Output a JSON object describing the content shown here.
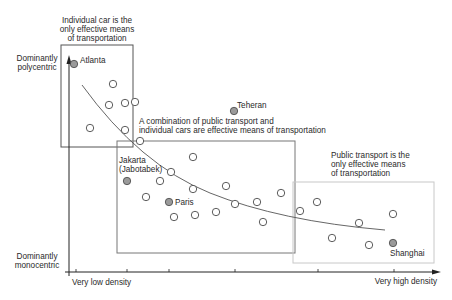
{
  "chart_data": {
    "type": "scatter",
    "title": "",
    "xlabel": "Density",
    "ylabel": "Urban structure",
    "x_axis": {
      "min_label": "Very low density",
      "max_label": "Very high density",
      "ticks_px": [
        76,
        127,
        169,
        235,
        318,
        394
      ]
    },
    "y_axis": {
      "top_label": [
        "Dominantly",
        "polycentric"
      ],
      "bottom_label": [
        "Dominantly",
        "monocentric"
      ]
    },
    "grid": false,
    "legend": null,
    "zones": [
      {
        "id": "car-zone",
        "label": [
          "Individual car is the",
          "only effective means",
          "of transportation"
        ],
        "x": 61,
        "y": 45,
        "w": 72,
        "h": 102,
        "stroke": "#555555"
      },
      {
        "id": "mixed-zone",
        "label": [
          "A combination of public transport and",
          "individual cars are effective means of transportation"
        ],
        "x": 117,
        "y": 141,
        "w": 178,
        "h": 112,
        "stroke": "#777777"
      },
      {
        "id": "public-zone",
        "label": [
          "Public transport is the",
          "only effective means",
          "of transportation"
        ],
        "x": 293,
        "y": 182,
        "w": 141,
        "h": 81,
        "stroke": "#c8c8c8"
      }
    ],
    "named_cities": [
      {
        "name": "Atlanta",
        "x": 74,
        "y": 64,
        "label_dx": 6,
        "label_dy": -1
      },
      {
        "name": "Teheran",
        "x": 234,
        "y": 111,
        "label_dx": 3,
        "label_dy": -3
      },
      {
        "name": [
          "Jakarta",
          "(Jabotabek)"
        ],
        "x": 127,
        "y": 181,
        "label_dx": -8,
        "label_dy": -22
      },
      {
        "name": "Paris",
        "x": 169,
        "y": 202,
        "label_dx": 6,
        "label_dy": 3
      },
      {
        "name": "Shanghai",
        "x": 393,
        "y": 243,
        "label_dx": -3,
        "label_dy": 13
      }
    ],
    "points": [
      [
        113,
        84
      ],
      [
        109,
        105
      ],
      [
        125,
        103
      ],
      [
        135,
        102
      ],
      [
        90,
        128
      ],
      [
        125,
        130
      ],
      [
        140,
        141
      ],
      [
        171,
        172
      ],
      [
        193,
        157
      ],
      [
        160,
        181
      ],
      [
        146,
        197
      ],
      [
        193,
        189
      ],
      [
        226,
        186
      ],
      [
        174,
        217
      ],
      [
        195,
        215
      ],
      [
        216,
        212
      ],
      [
        235,
        204
      ],
      [
        257,
        202
      ],
      [
        263,
        222
      ],
      [
        281,
        193
      ],
      [
        300,
        211
      ],
      [
        317,
        202
      ],
      [
        332,
        238
      ],
      [
        359,
        223
      ],
      [
        369,
        245
      ],
      [
        393,
        214
      ]
    ],
    "trend_curve": "M 82,85 Q 140,165 210,193 T 385,230"
  },
  "labels": {
    "car_zone_line1": "Individual car is the",
    "car_zone_line2": "only effective means",
    "car_zone_line3": "of transportation",
    "mixed_line1": "A combination of public transport and",
    "mixed_line2": "individual cars are effective means of transportation",
    "public_line1": "Public transport is the",
    "public_line2": "only effective means",
    "public_line3": "of transportation",
    "poly1": "Dominantly",
    "poly2": "polycentric",
    "mono1": "Dominantly",
    "mono2": "monocentric",
    "x_low": "Very low density",
    "x_high": "Very high density",
    "atlanta": "Atlanta",
    "teheran": "Teheran",
    "jakarta1": "Jakarta",
    "jakarta2": "(Jabotabek)",
    "paris": "Paris",
    "shanghai": "Shanghai"
  },
  "colors": {
    "named_fill": "#9a9a9a",
    "point_stroke": "#333333",
    "axis": "#222222",
    "curve": "#555555"
  }
}
